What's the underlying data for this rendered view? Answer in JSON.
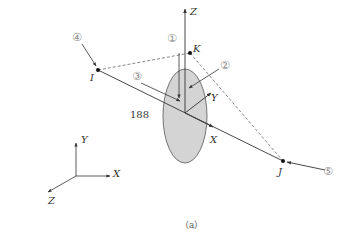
{
  "figure": {
    "caption": "（a）",
    "element_id_label": "188",
    "colors": {
      "line": "#333333",
      "ellipse_fill": "#d4d4d4",
      "ellipse_stroke": "#555555",
      "dashed": "#555555",
      "marker_text": "#888888"
    }
  },
  "nodes": {
    "I": "I",
    "J": "J",
    "K": "K"
  },
  "local_axes": {
    "x": "X",
    "y": "Y",
    "z": "Z"
  },
  "global_axes": {
    "x": "X",
    "y": "Y",
    "z": "Z"
  },
  "markers": [
    {
      "id": "1",
      "label": "①"
    },
    {
      "id": "2",
      "label": "②"
    },
    {
      "id": "3",
      "label": "③"
    },
    {
      "id": "4",
      "label": "④"
    },
    {
      "id": "5",
      "label": "⑤"
    }
  ]
}
